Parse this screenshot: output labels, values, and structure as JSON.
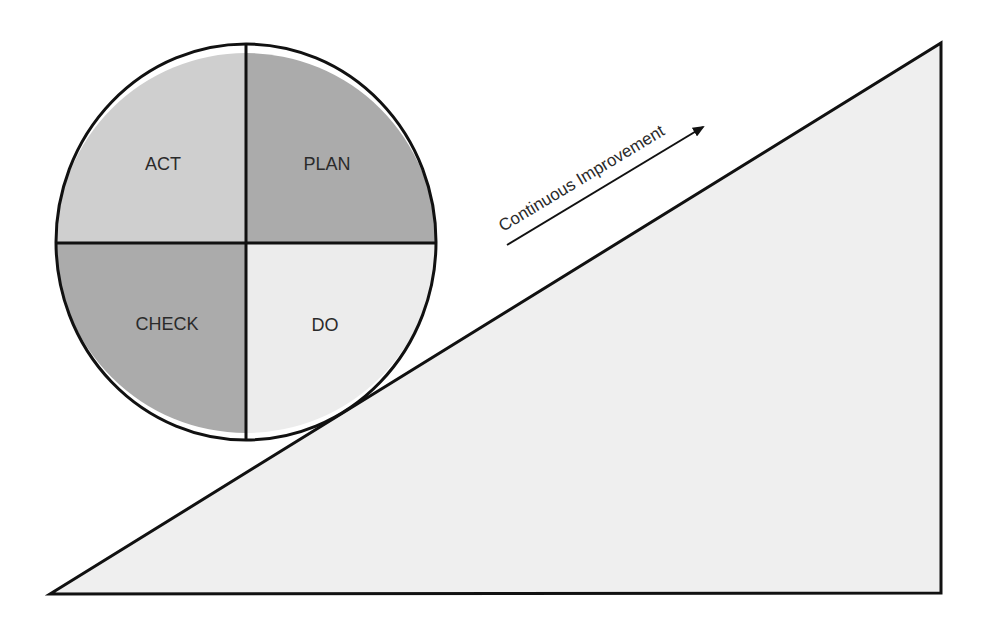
{
  "diagram": {
    "type": "PDCA cycle on improvement slope",
    "quadrants": [
      {
        "id": "act",
        "label": "ACT",
        "position": "top-left",
        "color": "#cfcfcf"
      },
      {
        "id": "plan",
        "label": "PLAN",
        "position": "top-right",
        "color": "#ababab"
      },
      {
        "id": "check",
        "label": "CHECK",
        "position": "bottom-left",
        "color": "#ababab"
      },
      {
        "id": "do",
        "label": "DO",
        "position": "bottom-right",
        "color": "#ececec"
      }
    ],
    "slope": {
      "color": "#efefef",
      "stroke": "#111111"
    },
    "arrow": {
      "label": "Continuous Improvement",
      "color": "#111111"
    }
  }
}
